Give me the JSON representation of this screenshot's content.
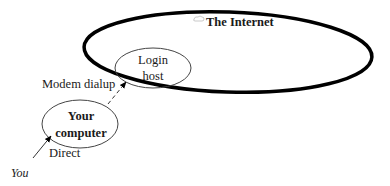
{
  "diagram": {
    "internet": {
      "label": "The Internet",
      "icon": "small-cloud-icon"
    },
    "nodes": {
      "login_host": {
        "line1": "Login",
        "line2": "host"
      },
      "your_computer": {
        "line1": "Your",
        "line2": "computer"
      }
    },
    "edges": {
      "modem": {
        "label": "Modem dialup",
        "style": "dashed"
      },
      "direct": {
        "label": "Direct",
        "style": "solid"
      }
    },
    "actor": {
      "label": "You"
    },
    "colors": {
      "stroke": "#000000",
      "thin_stroke": "#333333",
      "text": "#1a1a1a",
      "background": "#ffffff"
    }
  }
}
